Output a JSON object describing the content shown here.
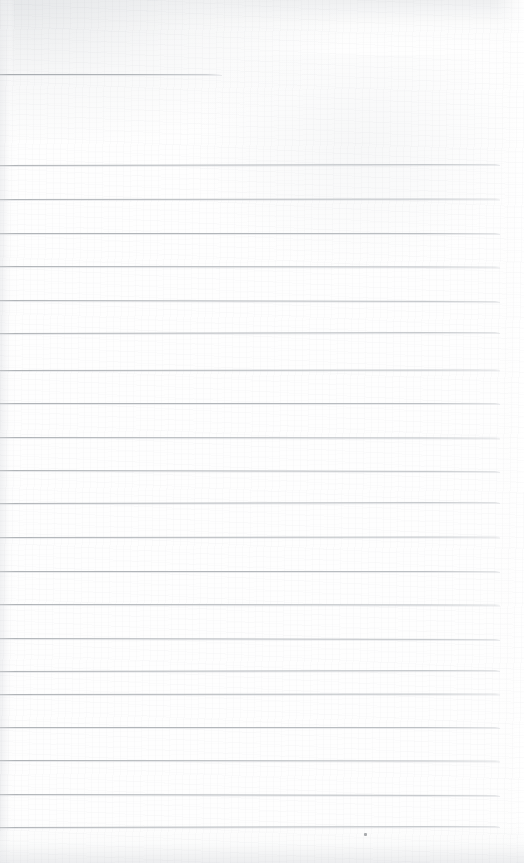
{
  "page": {
    "kind": "scanned-ruled-notebook-page",
    "width": 524,
    "height": 863,
    "background_color": "#fefefe",
    "rule_color": "#b2b6ba",
    "text_content": "",
    "note_label": ""
  },
  "rules": {
    "left_x": 0,
    "right_x": 500,
    "thickness": 1,
    "spacing": 33.7,
    "header_rule": {
      "name": "header-rule",
      "y": 74,
      "x_start": 0,
      "x_end": 222
    },
    "body_rules": [
      {
        "y": 165
      },
      {
        "y": 199
      },
      {
        "y": 233
      },
      {
        "y": 266
      },
      {
        "y": 300
      },
      {
        "y": 333
      },
      {
        "y": 370
      },
      {
        "y": 403
      },
      {
        "y": 437
      },
      {
        "y": 470
      },
      {
        "y": 503
      },
      {
        "y": 537
      },
      {
        "y": 571
      },
      {
        "y": 604
      },
      {
        "y": 638
      },
      {
        "y": 671
      },
      {
        "y": 694
      },
      {
        "y": 727
      },
      {
        "y": 760
      },
      {
        "y": 794
      },
      {
        "y": 827
      }
    ]
  },
  "artifacts": {
    "specks": [
      {
        "x": 364,
        "y": 833
      }
    ]
  }
}
